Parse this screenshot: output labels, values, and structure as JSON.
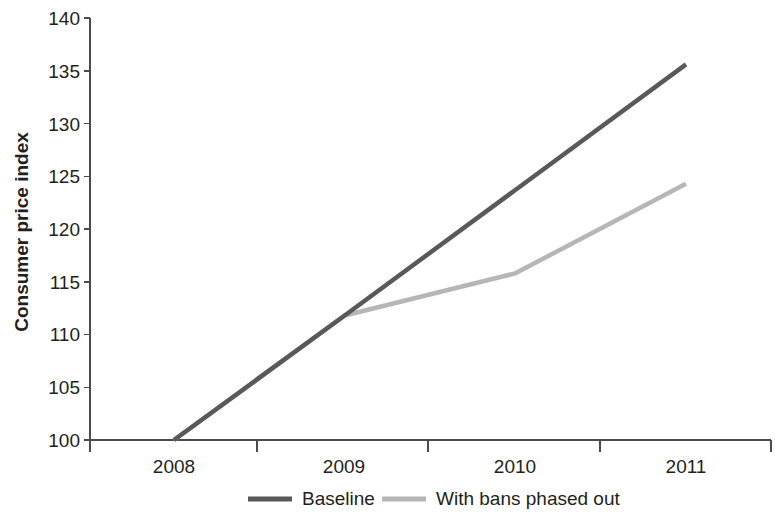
{
  "chart_data": {
    "type": "line",
    "title": "",
    "xlabel": "",
    "ylabel": "Consumer price index",
    "x": [
      2008,
      2009,
      2010,
      2011
    ],
    "xtick_labels": [
      "2008",
      "2009",
      "2010",
      "2011"
    ],
    "ytick_labels": [
      "100",
      "105",
      "110",
      "115",
      "120",
      "125",
      "130",
      "135",
      "140"
    ],
    "ytick_values": [
      100,
      105,
      110,
      115,
      120,
      125,
      130,
      135,
      140
    ],
    "ylim": [
      100,
      140
    ],
    "grid": false,
    "legend_position": "bottom",
    "series": [
      {
        "name": "Baseline",
        "color": "#595959",
        "values": [
          100,
          111.8,
          123.7,
          135.6
        ]
      },
      {
        "name": "With bans phased out",
        "color": "#b6b6b6",
        "values": [
          100,
          111.8,
          115.8,
          124.3
        ]
      }
    ]
  },
  "axes": {
    "y_title": "Consumer price index",
    "y_ticks": [
      {
        "label": "140",
        "value": 140
      },
      {
        "label": "135",
        "value": 135
      },
      {
        "label": "130",
        "value": 130
      },
      {
        "label": "125",
        "value": 125
      },
      {
        "label": "120",
        "value": 120
      },
      {
        "label": "115",
        "value": 115
      },
      {
        "label": "110",
        "value": 110
      },
      {
        "label": "105",
        "value": 105
      },
      {
        "label": "100",
        "value": 100
      }
    ],
    "x_ticks": [
      {
        "label": "2008"
      },
      {
        "label": "2009"
      },
      {
        "label": "2010"
      },
      {
        "label": "2011"
      }
    ]
  },
  "legend": {
    "items": [
      {
        "label": "Baseline",
        "color": "#595959"
      },
      {
        "label": "With bans phased out",
        "color": "#b6b6b6"
      }
    ]
  }
}
